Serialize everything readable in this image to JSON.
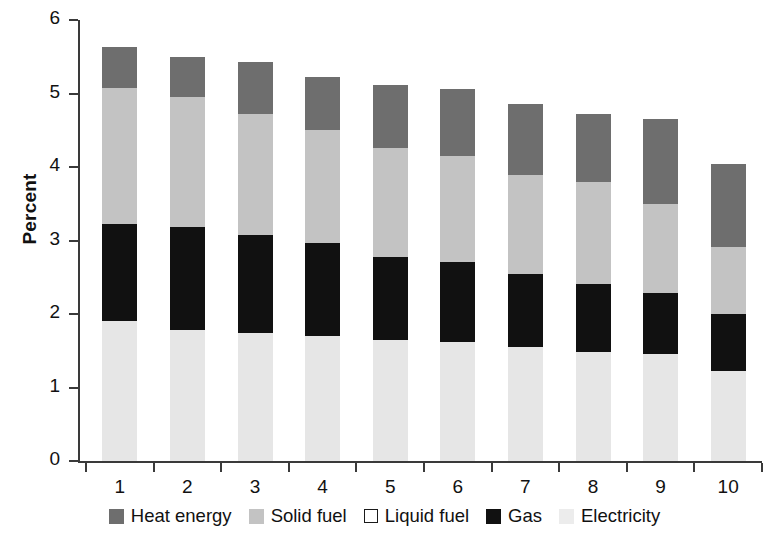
{
  "chart_data": {
    "type": "bar",
    "stacked": true,
    "title": "",
    "xlabel": "",
    "ylabel": "Percent",
    "ylim": [
      0,
      6
    ],
    "ytick_labels": [
      "0",
      "1",
      "2",
      "3",
      "4",
      "5",
      "6"
    ],
    "ytick_values": [
      0,
      1,
      2,
      3,
      4,
      5,
      6
    ],
    "grid": false,
    "legend_position": "bottom",
    "categories": [
      "1",
      "2",
      "3",
      "4",
      "5",
      "6",
      "7",
      "8",
      "9",
      "10"
    ],
    "series": [
      {
        "name": "Electricity",
        "color": "#e6e6e6",
        "values": [
          1.9,
          1.78,
          1.74,
          1.7,
          1.65,
          1.62,
          1.55,
          1.49,
          1.45,
          1.23
        ]
      },
      {
        "name": "Gas",
        "color": "#111111",
        "values": [
          1.33,
          1.4,
          1.33,
          1.26,
          1.13,
          1.09,
          1.0,
          0.92,
          0.84,
          0.77
        ]
      },
      {
        "name": "Liquid fuel",
        "color": "#ffffff",
        "values": [
          0.0,
          0.0,
          0.0,
          0.0,
          0.0,
          0.0,
          0.0,
          0.0,
          0.0,
          0.0
        ]
      },
      {
        "name": "Solid fuel",
        "color": "#c3c3c3",
        "values": [
          1.85,
          1.77,
          1.65,
          1.54,
          1.48,
          1.44,
          1.34,
          1.38,
          1.21,
          0.91
        ]
      },
      {
        "name": "Heat energy",
        "color": "#6e6e6e",
        "values": [
          0.55,
          0.55,
          0.71,
          0.73,
          0.85,
          0.91,
          0.97,
          0.93,
          1.16,
          1.13
        ]
      }
    ],
    "totals": [
      5.63,
      5.5,
      5.43,
      5.23,
      5.11,
      5.06,
      4.86,
      4.72,
      4.66,
      4.04
    ]
  },
  "axis": {
    "y_title": "Percent",
    "y_ticks": [
      "6",
      "5",
      "4",
      "3",
      "2",
      "1",
      "0"
    ],
    "x_ticks": [
      "1",
      "2",
      "3",
      "4",
      "5",
      "6",
      "7",
      "8",
      "9",
      "10"
    ]
  },
  "legend": {
    "items": [
      {
        "label": "Heat energy",
        "swatch": "heat-swatch",
        "color": "#6e6e6e"
      },
      {
        "label": "Solid fuel",
        "swatch": "solid-fuel-swatch",
        "color": "#c3c3c3"
      },
      {
        "label": "Liquid fuel",
        "swatch": "liquid-fuel-swatch",
        "color": "#ffffff"
      },
      {
        "label": "Gas",
        "swatch": "gas-swatch",
        "color": "#111111"
      },
      {
        "label": "Electricity",
        "swatch": "electricity-swatch",
        "color": "#ececec"
      }
    ]
  }
}
